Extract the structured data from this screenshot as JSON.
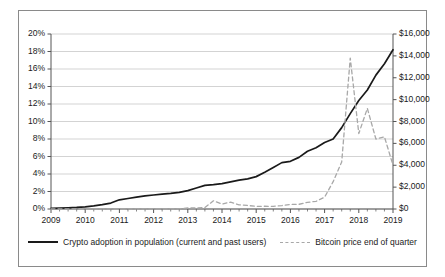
{
  "chart_data": {
    "type": "line",
    "title": "",
    "xlabel": "",
    "grid": true,
    "legend_position": "bottom",
    "x_tick_labels": [
      "2009",
      "2010",
      "2011",
      "2012",
      "2013",
      "2014",
      "2015",
      "2016",
      "2017",
      "2018",
      "2019"
    ],
    "xlim": [
      2009,
      2019
    ],
    "axes": {
      "left": {
        "label": "Crypto adoption in population",
        "tick_labels": [
          "0%",
          "2%",
          "4%",
          "6%",
          "8%",
          "10%",
          "12%",
          "14%",
          "16%",
          "18%",
          "20%"
        ],
        "tick_values": [
          0,
          2,
          4,
          6,
          8,
          10,
          12,
          14,
          16,
          18,
          20
        ],
        "ylim": [
          0,
          20
        ],
        "unit": "%"
      },
      "right": {
        "label": "Bitcoin price end of quarter",
        "tick_labels": [
          "$0",
          "$2,000",
          "$4,000",
          "$6,000",
          "$8,000",
          "$10,000",
          "$12,000",
          "$14,000",
          "$16,000"
        ],
        "tick_values": [
          0,
          2000,
          4000,
          6000,
          8000,
          10000,
          12000,
          14000,
          16000
        ],
        "ylim": [
          0,
          16000
        ],
        "unit": "$"
      }
    },
    "series": [
      {
        "name": "Crypto adoption in population (current and past users)",
        "axis": "left",
        "style": "solid",
        "color": "#1a1a1a",
        "x": [
          2009,
          2009.25,
          2009.5,
          2009.75,
          2010,
          2010.25,
          2010.5,
          2010.75,
          2011,
          2011.25,
          2011.5,
          2011.75,
          2012,
          2012.25,
          2012.5,
          2012.75,
          2013,
          2013.25,
          2013.5,
          2013.75,
          2014,
          2014.25,
          2014.5,
          2014.75,
          2015,
          2015.25,
          2015.5,
          2015.75,
          2016,
          2016.25,
          2016.5,
          2016.75,
          2017,
          2017.25,
          2017.5,
          2017.75,
          2018,
          2018.25,
          2018.5,
          2018.75,
          2019
        ],
        "values": [
          0.08,
          0.1,
          0.13,
          0.18,
          0.25,
          0.35,
          0.5,
          0.68,
          1.05,
          1.2,
          1.35,
          1.5,
          1.6,
          1.7,
          1.78,
          1.9,
          2.1,
          2.4,
          2.7,
          2.78,
          2.9,
          3.1,
          3.3,
          3.45,
          3.7,
          4.2,
          4.75,
          5.3,
          5.45,
          5.9,
          6.6,
          7.0,
          7.6,
          8.0,
          9.3,
          10.9,
          12.4,
          13.6,
          15.3,
          16.6,
          18.2
        ]
      },
      {
        "name": "Bitcoin price end of quarter",
        "axis": "right",
        "style": "dashed",
        "color": "#a8a8a8",
        "x": [
          2009,
          2009.25,
          2009.5,
          2009.75,
          2010,
          2010.25,
          2010.5,
          2010.75,
          2011,
          2011.25,
          2011.5,
          2011.75,
          2012,
          2012.25,
          2012.5,
          2012.75,
          2013,
          2013.25,
          2013.5,
          2013.75,
          2014,
          2014.25,
          2014.5,
          2014.75,
          2015,
          2015.25,
          2015.5,
          2015.75,
          2016,
          2016.25,
          2016.5,
          2016.75,
          2017,
          2017.25,
          2017.5,
          2017.75,
          2018,
          2018.25,
          2018.5,
          2018.75,
          2019
        ],
        "values": [
          0,
          0,
          0,
          0,
          0,
          5,
          6,
          3,
          1,
          16,
          8,
          5,
          5,
          5,
          12,
          13,
          93,
          97,
          135,
          750,
          450,
          630,
          380,
          320,
          245,
          250,
          240,
          315,
          415,
          430,
          610,
          700,
          1080,
          2500,
          4300,
          13800,
          6900,
          9200,
          6400,
          6600,
          4000
        ]
      }
    ]
  },
  "legend": {
    "entries": [
      {
        "label": "Crypto adoption in population (current and past users)",
        "style": "solid"
      },
      {
        "label": "Bitcoin price end of quarter",
        "style": "dashed"
      }
    ]
  },
  "colors": {
    "adoption_line": "#1a1a1a",
    "bitcoin_line": "#a8a8a8",
    "gridline": "#c8c8c8",
    "axis": "#555555",
    "frame": "#8a8a8a",
    "background": "#ffffff"
  }
}
